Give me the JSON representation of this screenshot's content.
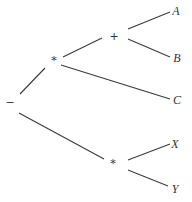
{
  "diagram": {
    "type": "expression-tree",
    "nodes": [
      {
        "id": "root",
        "label": "−",
        "kind": "operator",
        "x": 10,
        "y": 106
      },
      {
        "id": "mul1",
        "label": "*",
        "kind": "operator",
        "x": 54,
        "y": 64
      },
      {
        "id": "plus",
        "label": "+",
        "kind": "operator",
        "x": 114,
        "y": 40
      },
      {
        "id": "mul2",
        "label": "*",
        "kind": "operator",
        "x": 113,
        "y": 167
      },
      {
        "id": "A",
        "label": "A",
        "kind": "operand",
        "x": 176,
        "y": 15
      },
      {
        "id": "B",
        "label": "B",
        "kind": "operand",
        "x": 177,
        "y": 62
      },
      {
        "id": "C",
        "label": "C",
        "kind": "operand",
        "x": 177,
        "y": 104
      },
      {
        "id": "X",
        "label": "X",
        "kind": "operand",
        "x": 175,
        "y": 148
      },
      {
        "id": "Y",
        "label": "Y",
        "kind": "operand",
        "x": 175,
        "y": 193
      }
    ],
    "edges": [
      {
        "from": "root",
        "to": "mul1",
        "x1": 20,
        "y1": 94,
        "x2": 45,
        "y2": 68
      },
      {
        "from": "mul1",
        "to": "plus",
        "x1": 63,
        "y1": 57,
        "x2": 102,
        "y2": 38
      },
      {
        "from": "plus",
        "to": "A",
        "x1": 128,
        "y1": 29,
        "x2": 170,
        "y2": 12
      },
      {
        "from": "plus",
        "to": "B",
        "x1": 128,
        "y1": 39,
        "x2": 170,
        "y2": 57
      },
      {
        "from": "mul1",
        "to": "C",
        "x1": 61,
        "y1": 65,
        "x2": 170,
        "y2": 99
      },
      {
        "from": "root",
        "to": "mul2",
        "x1": 19,
        "y1": 113,
        "x2": 104,
        "y2": 159
      },
      {
        "from": "mul2",
        "to": "X",
        "x1": 128,
        "y1": 160,
        "x2": 170,
        "y2": 144
      },
      {
        "from": "mul2",
        "to": "Y",
        "x1": 128,
        "y1": 170,
        "x2": 168,
        "y2": 186
      }
    ]
  }
}
